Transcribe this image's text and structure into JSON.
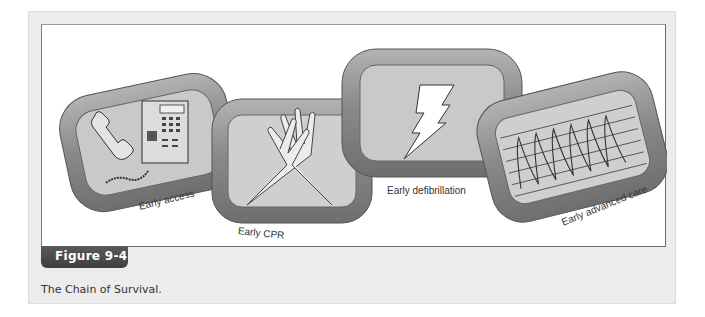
{
  "figure": {
    "number_label": "Figure 9-4",
    "caption": "The Chain of Survival.",
    "links": [
      {
        "label": "Early access",
        "icon": "telephone-icon"
      },
      {
        "label": "Early CPR",
        "icon": "crossed-hands-icon"
      },
      {
        "label": "Early defibrillation",
        "icon": "lightning-bolt-icon"
      },
      {
        "label": "Early advanced care",
        "icon": "ecg-waveform-icon"
      }
    ]
  },
  "colors": {
    "panel_bg": "#ececec",
    "tab_bg": "#4a4a4a",
    "link_metal": "#8f8f8f",
    "link_inner": "#c8c8c8"
  }
}
